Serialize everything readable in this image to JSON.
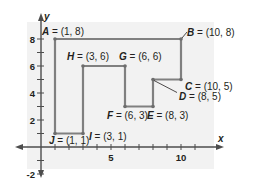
{
  "diagram": {
    "type": "coordinate-plane-polygon",
    "axes": {
      "x_label": "x",
      "y_label": "y",
      "x_range": [
        -2,
        11
      ],
      "y_range": [
        -2,
        9
      ],
      "x_tick_labels": [
        {
          "value": 5,
          "text": "5"
        },
        {
          "value": 10,
          "text": "10"
        }
      ],
      "y_tick_labels": [
        {
          "value": 8,
          "text": "8"
        },
        {
          "value": 6,
          "text": "6"
        },
        {
          "value": 4,
          "text": "4"
        },
        {
          "value": 2,
          "text": "2"
        },
        {
          "value": -2,
          "text": "-2"
        }
      ]
    },
    "points": [
      {
        "name": "A",
        "x": 1,
        "y": 8,
        "label": "A = (1, 8)"
      },
      {
        "name": "B",
        "x": 10,
        "y": 8,
        "label": "B = (10, 8)"
      },
      {
        "name": "C",
        "x": 10,
        "y": 5,
        "label": "C = (10, 5)"
      },
      {
        "name": "D",
        "x": 8,
        "y": 5,
        "label": "D = (8, 5)"
      },
      {
        "name": "E",
        "x": 8,
        "y": 3,
        "label": "E = (8, 3)"
      },
      {
        "name": "F",
        "x": 6,
        "y": 3,
        "label": "F = (6, 3)"
      },
      {
        "name": "G",
        "x": 6,
        "y": 6,
        "label": "G = (6, 6)"
      },
      {
        "name": "H",
        "x": 3,
        "y": 6,
        "label": "H = (3, 6)"
      },
      {
        "name": "I",
        "x": 3,
        "y": 1,
        "label": "I = (3, 1)"
      },
      {
        "name": "J",
        "x": 1,
        "y": 1,
        "label": "J = (1, 1)"
      }
    ],
    "polygon_order": [
      "A",
      "B",
      "C",
      "D",
      "E",
      "F",
      "G",
      "H",
      "I",
      "J"
    ],
    "colors": {
      "polygon_stroke": "#808080",
      "axis": "#4d4d4d",
      "background_panel": "#f2f2f2",
      "text": "#231f20"
    }
  }
}
